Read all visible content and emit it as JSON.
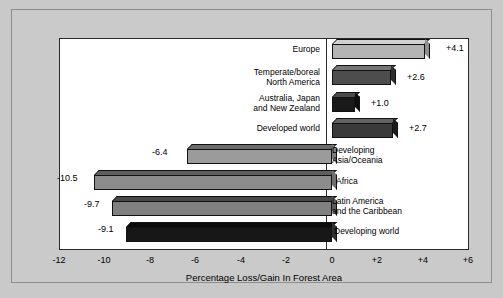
{
  "chart_data": {
    "type": "bar",
    "orientation": "horizontal",
    "title": "",
    "xlabel": "Percentage Loss/Gain In Forest Area",
    "ylabel": "",
    "xlim": [
      -12,
      6
    ],
    "grid": false,
    "legend": "none",
    "xticks": [
      "-12",
      "-10",
      "-8",
      "-6",
      "-4",
      "-2",
      "0",
      "+2",
      "+4",
      "+6"
    ],
    "xtick_values": [
      -12,
      -10,
      -8,
      -6,
      -4,
      -2,
      0,
      2,
      4,
      6
    ],
    "categories": [
      "Europe",
      "Temperate/boreal North America",
      "Australia, Japan and New Zealand",
      "Developed world",
      "Developing Asia/Oceania",
      "Africa",
      "Latin America and the Caribbean",
      "Developing world"
    ],
    "values": [
      4.1,
      2.6,
      1.0,
      2.7,
      -6.4,
      -10.5,
      -9.7,
      -9.1
    ],
    "data_labels": [
      "+4.1",
      "+2.6",
      "+1.0",
      "+2.7",
      "-6.4",
      "-10.5",
      "-9.7",
      "-9.1"
    ],
    "bars": [
      {
        "category_lines": [
          "Europe"
        ],
        "value": 4.1,
        "label": "+4.1",
        "color": "#b4b4b4",
        "top_color": "#d2d2d2",
        "side_color": "#8e8e8e"
      },
      {
        "category_lines": [
          "Temperate/boreal",
          "North America"
        ],
        "value": 2.6,
        "label": "+2.6",
        "color": "#4d4d4d",
        "top_color": "#767676",
        "side_color": "#2e2e2e"
      },
      {
        "category_lines": [
          "Australia, Japan",
          "and New Zealand"
        ],
        "value": 1.0,
        "label": "+1.0",
        "color": "#1a1a1a",
        "top_color": "#4a4a4a",
        "side_color": "#0d0d0d"
      },
      {
        "category_lines": [
          "Developed world"
        ],
        "value": 2.7,
        "label": "+2.7",
        "color": "#3a3a3a",
        "top_color": "#636363",
        "side_color": "#1c1c1c"
      },
      {
        "category_lines": [
          "Developing",
          "Asia/Oceania"
        ],
        "value": -6.4,
        "label": "-6.4",
        "color": "#9b9b9b",
        "top_color": "#6b6b6b",
        "side_color": "#7d7d7d"
      },
      {
        "category_lines": [
          "Africa"
        ],
        "value": -10.5,
        "label": "-10.5",
        "color": "#8c8c8c",
        "top_color": "#5f5f5f",
        "side_color": "#6f6f6f"
      },
      {
        "category_lines": [
          "Latin America",
          "and the Caribbean"
        ],
        "value": -9.7,
        "label": "-9.7",
        "color": "#808080",
        "top_color": "#474747",
        "side_color": "#5c5c5c"
      },
      {
        "category_lines": [
          "Developing world"
        ],
        "value": -9.1,
        "label": "-9.1",
        "color": "#171717",
        "top_color": "#0b0b0b",
        "side_color": "#303030"
      }
    ]
  },
  "labels": {
    "b0_cat0": "Europe",
    "b1_cat0": "Temperate/boreal",
    "b1_cat1": "North America",
    "b2_cat0": "Australia, Japan",
    "b2_cat1": "and New Zealand",
    "b3_cat0": "Developed world",
    "b4_cat0": "Developing",
    "b4_cat1": "Asia/Oceania",
    "b5_cat0": "Africa",
    "b6_cat0": "Latin America",
    "b6_cat1": "and the Caribbean",
    "b7_cat0": "Developing world",
    "v0": "+4.1",
    "v1": "+2.6",
    "v2": "+1.0",
    "v3": "+2.7",
    "v4": "-6.4",
    "v5": "-10.5",
    "v6": "-9.7",
    "v7": "-9.1",
    "t0": "-12",
    "t1": "-10",
    "t2": "-8",
    "t3": "-6",
    "t4": "-4",
    "t5": "-2",
    "t6": "0",
    "t7": "+2",
    "t8": "+4",
    "t9": "+6",
    "axis_title": "Percentage Loss/Gain In Forest Area"
  }
}
